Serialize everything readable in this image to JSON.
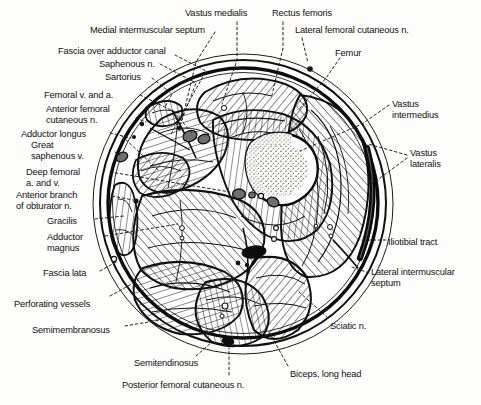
{
  "figure": {
    "type": "anatomical-cross-section",
    "region": "mid-thigh transverse section",
    "style": "black-and-white line drawing with hatched muscle bellies and dashed leader lines"
  },
  "labels": [
    {
      "id": "vastus-medialis",
      "text": "Vastus medialis",
      "x": 185,
      "y": 8,
      "align": "left"
    },
    {
      "id": "rectus-femoris",
      "text": "Rectus femoris",
      "x": 272,
      "y": 8,
      "align": "left"
    },
    {
      "id": "medial-intermuscular-septum",
      "text": "Medial intermuscular septum",
      "x": 90,
      "y": 25,
      "align": "left"
    },
    {
      "id": "lateral-femoral-cutaneous-n",
      "text": "Lateral femoral cutaneous n.",
      "x": 295,
      "y": 25,
      "align": "left"
    },
    {
      "id": "fascia-over-adductor-canal",
      "text": "Fascia over adductor canal",
      "x": 58,
      "y": 46,
      "align": "left"
    },
    {
      "id": "femur",
      "text": "Femur",
      "x": 335,
      "y": 48,
      "align": "left"
    },
    {
      "id": "saphenous-n",
      "text": "Saphenous n.",
      "x": 99,
      "y": 59,
      "align": "left"
    },
    {
      "id": "sartorius",
      "text": "Sartorius",
      "x": 105,
      "y": 72,
      "align": "left"
    },
    {
      "id": "femoral-v-and-a",
      "text": "Femoral v. and a.",
      "x": 44,
      "y": 90,
      "align": "left"
    },
    {
      "id": "vastus-intermedius",
      "text": "Vastus\nintermedius",
      "x": 392,
      "y": 99,
      "align": "left"
    },
    {
      "id": "anterior-femoral-cutaneous-n",
      "text": "Anterior femoral\ncutaneous n.",
      "x": 46,
      "y": 104,
      "align": "left"
    },
    {
      "id": "adductor-longus",
      "text": "Adductor longus",
      "x": 21,
      "y": 129,
      "align": "left"
    },
    {
      "id": "great-saphenous-v",
      "text": "Great\nsaphenous v.",
      "x": 31,
      "y": 140,
      "align": "left"
    },
    {
      "id": "vastus-lateralis",
      "text": "Vastus\nlateralis",
      "x": 410,
      "y": 148,
      "align": "left"
    },
    {
      "id": "deep-femoral-a-and-v",
      "text": "Deep femoral\na. and v.",
      "x": 26,
      "y": 167,
      "align": "left"
    },
    {
      "id": "anterior-branch-of-obturator-n",
      "text": "Anterior branch\nof obturator n.",
      "x": 16,
      "y": 190,
      "align": "left"
    },
    {
      "id": "gracilis",
      "text": "Gracilis",
      "x": 47,
      "y": 216,
      "align": "left"
    },
    {
      "id": "adductor-magnus",
      "text": "Adductor\nmagnus",
      "x": 47,
      "y": 232,
      "align": "left"
    },
    {
      "id": "iliotibial-tract",
      "text": "Iliotibial tract",
      "x": 388,
      "y": 237,
      "align": "left"
    },
    {
      "id": "fascia-lata",
      "text": "Fascia lata",
      "x": 43,
      "y": 268,
      "align": "left"
    },
    {
      "id": "lateral-intermuscular-septum",
      "text": "Lateral intermuscular\nseptum",
      "x": 371,
      "y": 267,
      "align": "left"
    },
    {
      "id": "perforating-vessels",
      "text": "Perforating vessels",
      "x": 14,
      "y": 299,
      "align": "left"
    },
    {
      "id": "sciatic-n",
      "text": "Sciatic n.",
      "x": 330,
      "y": 321,
      "align": "left"
    },
    {
      "id": "semimembranosus",
      "text": "Semimembranosus",
      "x": 32,
      "y": 325,
      "align": "left"
    },
    {
      "id": "semitendinosus",
      "text": "Semitendinosus",
      "x": 134,
      "y": 358,
      "align": "left"
    },
    {
      "id": "biceps-long-head",
      "text": "Biceps, long head",
      "x": 290,
      "y": 369,
      "align": "left"
    },
    {
      "id": "posterior-femoral-cutaneous-n",
      "text": "Posterior femoral cutaneous n.",
      "x": 122,
      "y": 380,
      "align": "left"
    }
  ],
  "colors": {
    "ink": "#141414",
    "paper": "#fdfdfb",
    "muscle_fill": "#ffffff",
    "vessel_fill": "#6e6e6e",
    "vessel_dark": "#0d0d0d",
    "marrow": "#f7f7f4"
  }
}
